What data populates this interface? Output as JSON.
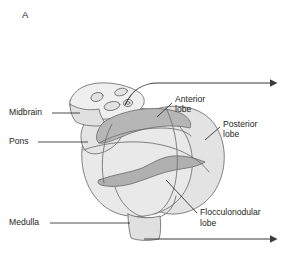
{
  "figure": {
    "panel_letter": "A",
    "background_color": "#ffffff"
  },
  "palette": {
    "outline": "#6d6d6d",
    "body_fill": "#e9e9e9",
    "lobe_fill": "#e3e3e3",
    "shaded_band": "#b6b6b6",
    "vermis_fill": "#b0b0b0",
    "midbrain_fill": "#efefef",
    "text": "#231f20",
    "arrow": "#3b3b3b"
  },
  "labels": [
    {
      "id": "midbrain",
      "text": "Midbrain",
      "x": 9,
      "y": 113,
      "anchor": "start"
    },
    {
      "id": "pons",
      "text": "Pons",
      "x": 9,
      "y": 142,
      "anchor": "start"
    },
    {
      "id": "medulla",
      "text": "Medulla",
      "x": 9,
      "y": 223,
      "anchor": "start"
    },
    {
      "id": "anterior-lobe-line1",
      "text": "Anterior",
      "x": 175,
      "y": 100,
      "anchor": "start"
    },
    {
      "id": "anterior-lobe-line2",
      "text": "lobe",
      "x": 175,
      "y": 110,
      "anchor": "start"
    },
    {
      "id": "posterior-lobe-line1",
      "text": "Posterior",
      "x": 223,
      "y": 125,
      "anchor": "start"
    },
    {
      "id": "posterior-lobe-line2",
      "text": "lobe",
      "x": 223,
      "y": 135,
      "anchor": "start"
    },
    {
      "id": "flocculonodular-lobe-line1",
      "text": "Flocculonodular",
      "x": 200,
      "y": 213,
      "anchor": "start"
    },
    {
      "id": "flocculonodular-lobe-line2",
      "text": "lobe",
      "x": 200,
      "y": 224,
      "anchor": "start"
    }
  ],
  "structures": [
    {
      "id": "midbrain",
      "name": "Midbrain"
    },
    {
      "id": "pons",
      "name": "Pons"
    },
    {
      "id": "medulla",
      "name": "Medulla"
    },
    {
      "id": "anterior-lobe",
      "name": "Anterior lobe"
    },
    {
      "id": "posterior-lobe",
      "name": "Posterior lobe"
    },
    {
      "id": "flocculonodular-lobe",
      "name": "Flocculonodular lobe"
    },
    {
      "id": "vermis",
      "name": "Vermis"
    },
    {
      "id": "colliculi",
      "name": "Colliculi"
    }
  ],
  "arrows": [
    {
      "id": "anterior-direction-arrow",
      "position": "top-right"
    },
    {
      "id": "inferior-direction-arrow",
      "position": "bottom-right"
    }
  ]
}
